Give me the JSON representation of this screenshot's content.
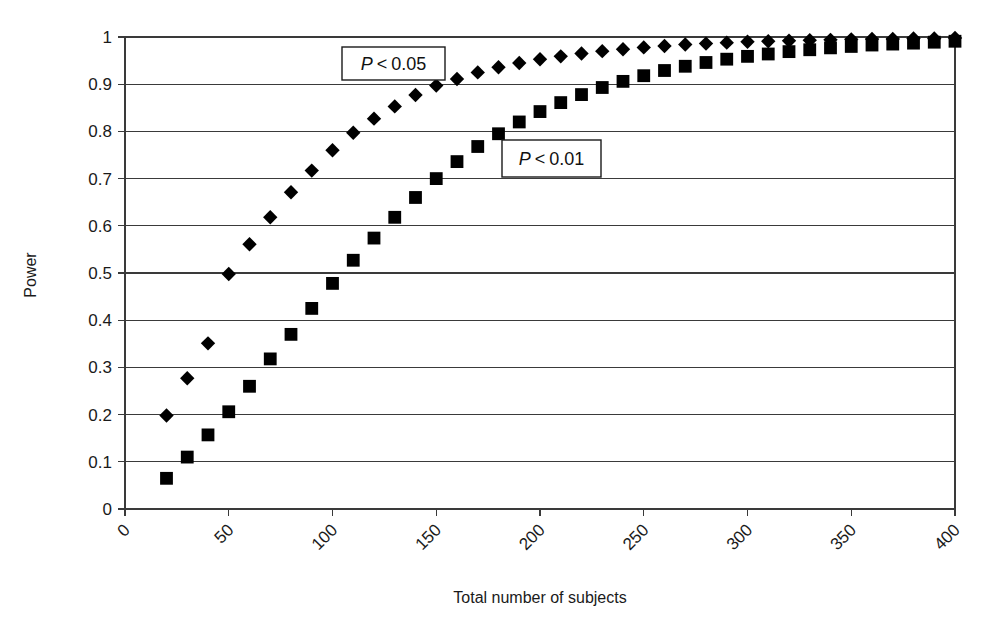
{
  "figure": {
    "ylabel": "Power",
    "xlabel": "Total number of subjects",
    "annotations": [
      {
        "name": "p05",
        "p": "P",
        "op": "<",
        "value": "0.05"
      },
      {
        "name": "p01",
        "p": "P",
        "op": "<",
        "value": "0.01"
      }
    ],
    "caption_fragment": ""
  },
  "axes": {
    "y_ticks": [
      "0",
      "0.1",
      "0.2",
      "0.3",
      "0.4",
      "0.5",
      "0.6",
      "0.7",
      "0.8",
      "0.9",
      "1"
    ],
    "x_ticks": [
      "0",
      "50",
      "100",
      "150",
      "200",
      "250",
      "300",
      "350",
      "400"
    ]
  },
  "chart_data": {
    "type": "scatter",
    "title": "",
    "xlabel": "Total number of subjects",
    "ylabel": "Power",
    "xlim": [
      0,
      400
    ],
    "ylim": [
      0,
      1
    ],
    "xticks": [
      0,
      50,
      100,
      150,
      200,
      250,
      300,
      350,
      400
    ],
    "yticks": [
      0,
      0.1,
      0.2,
      0.3,
      0.4,
      0.5,
      0.6,
      0.7,
      0.8,
      0.9,
      1
    ],
    "grid": "horizontal",
    "legend": "inline-annotation-boxes",
    "marker_color": "#000000",
    "series": [
      {
        "name": "P < 0.05",
        "marker": "diamond",
        "x": [
          20,
          30,
          40,
          50,
          60,
          70,
          80,
          90,
          100,
          110,
          120,
          130,
          140,
          150,
          160,
          170,
          180,
          190,
          200,
          210,
          220,
          230,
          240,
          250,
          260,
          270,
          280,
          290,
          300,
          310,
          320,
          330,
          340,
          350,
          360,
          370,
          380,
          390,
          400
        ],
        "y": [
          0.198,
          0.277,
          0.351,
          0.498,
          0.561,
          0.618,
          0.671,
          0.717,
          0.76,
          0.797,
          0.827,
          0.853,
          0.877,
          0.897,
          0.911,
          0.925,
          0.936,
          0.945,
          0.953,
          0.959,
          0.965,
          0.97,
          0.974,
          0.978,
          0.981,
          0.984,
          0.986,
          0.988,
          0.99,
          0.991,
          0.992,
          0.993,
          0.994,
          0.995,
          0.996,
          0.996,
          0.997,
          0.997,
          0.998
        ]
      },
      {
        "name": "P < 0.01",
        "marker": "square",
        "x": [
          20,
          30,
          40,
          50,
          60,
          70,
          80,
          90,
          100,
          110,
          120,
          130,
          140,
          150,
          160,
          170,
          180,
          190,
          200,
          210,
          220,
          230,
          240,
          250,
          260,
          270,
          280,
          290,
          300,
          310,
          320,
          330,
          340,
          350,
          360,
          370,
          380,
          390,
          400
        ],
        "y": [
          0.065,
          0.11,
          0.157,
          0.206,
          0.26,
          0.318,
          0.37,
          0.425,
          0.478,
          0.527,
          0.574,
          0.618,
          0.66,
          0.7,
          0.736,
          0.768,
          0.795,
          0.82,
          0.842,
          0.861,
          0.878,
          0.893,
          0.906,
          0.918,
          0.929,
          0.938,
          0.946,
          0.953,
          0.959,
          0.964,
          0.969,
          0.973,
          0.977,
          0.98,
          0.983,
          0.985,
          0.987,
          0.989,
          0.991
        ]
      }
    ]
  }
}
